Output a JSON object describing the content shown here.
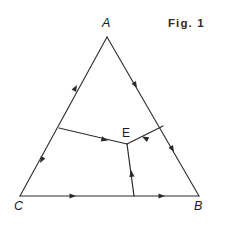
{
  "figure": {
    "caption": "Fig. 1",
    "kind": "geometry-diagram",
    "stroke_color": "#2b2b2b",
    "background_color": "#ffffff",
    "label_color": "#1a1a1a",
    "vertices": [
      {
        "name": "A",
        "label": "A",
        "x": 107,
        "y": 37
      },
      {
        "name": "B",
        "label": "B",
        "x": 199,
        "y": 196
      },
      {
        "name": "C",
        "label": "C",
        "x": 20,
        "y": 196
      }
    ],
    "interior_points": [
      {
        "name": "E",
        "label": "E",
        "x": 127,
        "y": 144
      }
    ],
    "side_endpoints": [
      {
        "name": "side-CA",
        "x1": 20,
        "y1": 196,
        "x2": 107,
        "y2": 37
      },
      {
        "name": "side-AB",
        "x1": 107,
        "y1": 37,
        "x2": 199,
        "y2": 196
      },
      {
        "name": "side-CB",
        "x1": 20,
        "y1": 196,
        "x2": 199,
        "y2": 196
      }
    ],
    "cevian_endpoints": [
      {
        "name": "segment-left-to-E",
        "x1": 59,
        "y1": 128,
        "x2": 127,
        "y2": 144
      },
      {
        "name": "segment-right-to-E",
        "x1": 163,
        "y1": 126,
        "x2": 127,
        "y2": 144
      },
      {
        "name": "segment-bottom-to-E",
        "x1": 134,
        "y1": 196,
        "x2": 127,
        "y2": 144
      }
    ],
    "arrow_markers": [
      {
        "name": "arrow-side-CA-upper",
        "x": 77,
        "y": 85,
        "angle": -61.3
      },
      {
        "name": "arrow-side-CA-lower",
        "x": 40,
        "y": 163,
        "angle": 118.7
      },
      {
        "name": "arrow-side-AB-upper",
        "x": 137,
        "y": 88,
        "angle": 59.9
      },
      {
        "name": "arrow-side-AB-lower",
        "x": 174,
        "y": 152,
        "angle": 59.9
      },
      {
        "name": "arrow-side-CB-left",
        "x": 76,
        "y": 196,
        "angle": 0
      },
      {
        "name": "arrow-side-CB-right",
        "x": 165,
        "y": 196,
        "angle": 0
      },
      {
        "name": "arrow-segment-left-to-E",
        "x": 108,
        "y": 140,
        "angle": 13.2
      },
      {
        "name": "arrow-segment-right-to-E",
        "x": 142,
        "y": 137,
        "angle": 206.6
      },
      {
        "name": "arrow-segment-bottom-to-E",
        "x": 131,
        "y": 172,
        "angle": -97.7
      }
    ]
  }
}
